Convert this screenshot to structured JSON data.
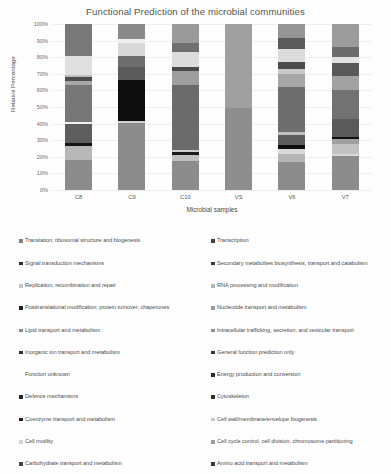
{
  "chart_data": {
    "type": "bar",
    "subtype": "stacked-percentage",
    "title": "Functional Prediction of the microbial communities",
    "xlabel": "Microbial samples",
    "ylabel": "Relative Percentage",
    "grid": true,
    "legend_position": "bottom",
    "ylim": [
      0,
      100
    ],
    "ytick_labels": [
      "0%",
      "10%",
      "20%",
      "30%",
      "40%",
      "50%",
      "60%",
      "70%",
      "80%",
      "90%",
      "100%"
    ],
    "ytick_values": [
      0,
      10,
      20,
      30,
      40,
      50,
      60,
      70,
      80,
      90,
      100
    ],
    "categories": [
      "C8",
      "C9",
      "C10",
      "VS",
      "V6",
      "V7"
    ],
    "series": [
      {
        "name": "Translation, ribosomal structure and biogenesis",
        "color": "#8c8c8c",
        "values": [
          18.0,
          40.5,
          17.5,
          49.5,
          17.0,
          20.5
        ]
      },
      {
        "name": "Transcription",
        "color": "#a6a6a6",
        "values": [
          8.5,
          0.8,
          4.5,
          50.5,
          4.5,
          2.0
        ]
      },
      {
        "name": "Signal transduction mechanisms",
        "color": "#151515",
        "values": [
          1.8,
          25.0,
          1.5,
          0.0,
          2.5,
          1.0
        ]
      },
      {
        "name": "Secondary metabolites biosynthesis, transport and catabolism",
        "color": "#595959",
        "values": [
          11.0,
          0.0,
          39.5,
          0.0,
          3.5,
          0.0
        ]
      },
      {
        "name": "Replication, recombination and repair",
        "color": "#bfbfbf",
        "values": [
          0.0,
          0.0,
          0.0,
          0.0,
          3.0,
          5.5
        ]
      },
      {
        "name": "RNA processing and modification",
        "color": "#d9d9d9",
        "values": [
          0.0,
          0.0,
          0.0,
          0.0,
          4.5,
          2.5
        ]
      },
      {
        "name": "Posttranslational modification, protein turnover, chaperones",
        "color": "#6e6e6e",
        "values": [
          13.5,
          6.0,
          0.0,
          0.0,
          23.0,
          25.0
        ]
      },
      {
        "name": "Nucleotide transport and metabolism",
        "color": "#9e9e9e",
        "values": [
          4.5,
          0.0,
          8.5,
          0.0,
          5.0,
          4.5
        ]
      },
      {
        "name": "Lipid transport and metabolism",
        "color": "#4a4a4a",
        "values": [
          3.5,
          7.5,
          2.0,
          0.0,
          5.0,
          10.0
        ]
      },
      {
        "name": "Intracellular trafficking, secretion, and vesicular transport",
        "color": "#c8c8c8",
        "values": [
          0.0,
          0.0,
          0.0,
          0.0,
          2.0,
          3.5
        ]
      },
      {
        "name": "Inorganic ion transport and metabolism",
        "color": "#787878",
        "values": [
          0.0,
          0.0,
          0.0,
          0.0,
          0.0,
          0.0
        ]
      },
      {
        "name": "General function prediction only",
        "color": "#5f5f5f",
        "values": [
          0.0,
          0.0,
          0.0,
          0.0,
          0.0,
          0.0
        ]
      },
      {
        "name": "Function unknown",
        "color": "#ffffff",
        "values": [
          10.5,
          5.0,
          10.5,
          0.0,
          6.0,
          4.5
        ]
      },
      {
        "name": "Energy production and conversion",
        "color": "#3d3d3d",
        "values": [
          0.0,
          0.0,
          0.0,
          0.0,
          0.0,
          0.0
        ]
      },
      {
        "name": "Defence mechanisms",
        "color": "#2b2b2b",
        "values": [
          0.0,
          0.0,
          0.0,
          0.0,
          0.0,
          0.0
        ]
      },
      {
        "name": "Cytoskeleton",
        "color": "#525252",
        "values": [
          0.0,
          0.0,
          0.0,
          0.0,
          0.0,
          0.0
        ]
      },
      {
        "name": "Coenzyme transport and metabolism",
        "color": "#1f1f1f",
        "values": [
          0.0,
          0.0,
          0.0,
          0.0,
          0.0,
          0.0
        ]
      },
      {
        "name": "Cell wall/membrane/envelope biogenesis",
        "color": "#d0d0d0",
        "values": [
          0.0,
          0.0,
          0.0,
          0.0,
          0.0,
          0.0
        ]
      },
      {
        "name": "Cell motility",
        "color": "#e2e2e2",
        "values": [
          0.0,
          0.0,
          0.0,
          0.0,
          0.0,
          0.0
        ]
      },
      {
        "name": "Cell cycle control, cell division, chromosome partitioning",
        "color": "#b0b0b0",
        "values": [
          0.0,
          0.0,
          0.0,
          0.0,
          0.0,
          0.0
        ]
      },
      {
        "name": "Carbohydrate transport and metabolism",
        "color": "#707070",
        "values": [
          0.0,
          0.0,
          0.0,
          0.0,
          0.0,
          0.0
        ]
      },
      {
        "name": "Amino acid transport and metabolism",
        "color": "#868686",
        "values": [
          28.7,
          15.2,
          16.0,
          0.0,
          24.0,
          21.0
        ]
      }
    ],
    "stacks": {
      "C8": [
        {
          "from": 0,
          "to": 18.0,
          "color": "#8c8c8c"
        },
        {
          "from": 18.0,
          "to": 26.5,
          "color": "#b8b8b8"
        },
        {
          "from": 26.5,
          "to": 28.3,
          "color": "#151515"
        },
        {
          "from": 28.3,
          "to": 39.5,
          "color": "#5e5e5e"
        },
        {
          "from": 39.5,
          "to": 41.0,
          "color": "#efefef"
        },
        {
          "from": 41.0,
          "to": 63.0,
          "color": "#777777"
        },
        {
          "from": 63.0,
          "to": 65.5,
          "color": "#a8a8a8"
        },
        {
          "from": 65.5,
          "to": 68.0,
          "color": "#4c4c4c"
        },
        {
          "from": 68.0,
          "to": 69.5,
          "color": "#bdbdbd"
        },
        {
          "from": 69.5,
          "to": 81.0,
          "color": "#e0e0e0"
        },
        {
          "from": 81.0,
          "to": 100,
          "color": "#787878"
        }
      ],
      "C9": [
        {
          "from": 0,
          "to": 40.5,
          "color": "#8c8c8c"
        },
        {
          "from": 40.5,
          "to": 41.5,
          "color": "#d2d2d2"
        },
        {
          "from": 41.5,
          "to": 66.5,
          "color": "#0d0d0d"
        },
        {
          "from": 66.5,
          "to": 74.0,
          "color": "#5a5a5a"
        },
        {
          "from": 74.0,
          "to": 80.5,
          "color": "#6e6e6e"
        },
        {
          "from": 80.5,
          "to": 88.5,
          "color": "#d8d8d8"
        },
        {
          "from": 88.5,
          "to": 91.0,
          "color": "#f0f0f0"
        },
        {
          "from": 91.0,
          "to": 100,
          "color": "#8a8a8a"
        }
      ],
      "C10": [
        {
          "from": 0,
          "to": 17.5,
          "color": "#8c8c8c"
        },
        {
          "from": 17.5,
          "to": 21.0,
          "color": "#bfbfbf"
        },
        {
          "from": 21.0,
          "to": 23.0,
          "color": "#1a1a1a"
        },
        {
          "from": 23.0,
          "to": 24.0,
          "color": "#cfcfcf"
        },
        {
          "from": 24.0,
          "to": 63.5,
          "color": "#6b6b6b"
        },
        {
          "from": 63.5,
          "to": 71.5,
          "color": "#9e9e9e"
        },
        {
          "from": 71.5,
          "to": 74.0,
          "color": "#4a4a4a"
        },
        {
          "from": 74.0,
          "to": 83.0,
          "color": "#dcdcdc"
        },
        {
          "from": 83.0,
          "to": 88.5,
          "color": "#6f6f6f"
        },
        {
          "from": 88.5,
          "to": 100,
          "color": "#9a9a9a"
        }
      ],
      "VS": [
        {
          "from": 0,
          "to": 49.5,
          "color": "#8e8e8e"
        },
        {
          "from": 49.5,
          "to": 100,
          "color": "#a0a0a0"
        }
      ],
      "V6": [
        {
          "from": 0,
          "to": 17.0,
          "color": "#8c8c8c"
        },
        {
          "from": 17.0,
          "to": 21.5,
          "color": "#b5b5b5"
        },
        {
          "from": 21.5,
          "to": 24.5,
          "color": "#dadada"
        },
        {
          "from": 24.5,
          "to": 27.0,
          "color": "#0f0f0f"
        },
        {
          "from": 27.0,
          "to": 33.0,
          "color": "#5c5c5c"
        },
        {
          "from": 33.0,
          "to": 35.0,
          "color": "#c0c0c0"
        },
        {
          "from": 35.0,
          "to": 62.0,
          "color": "#6e6e6e"
        },
        {
          "from": 62.0,
          "to": 70.0,
          "color": "#a6a6a6"
        },
        {
          "from": 70.0,
          "to": 73.0,
          "color": "#cacaca"
        },
        {
          "from": 73.0,
          "to": 77.0,
          "color": "#4c4c4c"
        },
        {
          "from": 77.0,
          "to": 85.0,
          "color": "#dcdcdc"
        },
        {
          "from": 85.0,
          "to": 91.5,
          "color": "#5a5a5a"
        },
        {
          "from": 91.5,
          "to": 100,
          "color": "#949494"
        }
      ],
      "V7": [
        {
          "from": 0,
          "to": 20.5,
          "color": "#8c8c8c"
        },
        {
          "from": 20.5,
          "to": 22.0,
          "color": "#d8d8d8"
        },
        {
          "from": 22.0,
          "to": 28.0,
          "color": "#c2c2c2"
        },
        {
          "from": 28.0,
          "to": 30.5,
          "color": "#a0a0a0"
        },
        {
          "from": 30.5,
          "to": 31.8,
          "color": "#111111"
        },
        {
          "from": 31.8,
          "to": 43.0,
          "color": "#5a5a5a"
        },
        {
          "from": 43.0,
          "to": 60.5,
          "color": "#727272"
        },
        {
          "from": 60.5,
          "to": 68.5,
          "color": "#a2a2a2"
        },
        {
          "from": 68.5,
          "to": 76.5,
          "color": "#585858"
        },
        {
          "from": 76.5,
          "to": 80.0,
          "color": "#e2e2e2"
        },
        {
          "from": 80.0,
          "to": 86.5,
          "color": "#6b6b6b"
        },
        {
          "from": 86.5,
          "to": 100,
          "color": "#9c9c9c"
        }
      ]
    },
    "legend_entries": [
      {
        "label": "Translation, ribosomal structure and biogenesis",
        "color": "#7f7f7f"
      },
      {
        "label": "Transcription",
        "color": "#3f3f3f"
      },
      {
        "label": "Signal transduction mechanisms",
        "color": "#2a2a2a"
      },
      {
        "label": "Secondary metabolites biosynthesis, transport and catabolism",
        "color": "#3a3a3a"
      },
      {
        "label": "Replication, recombination and repair",
        "color": "#c4c4c4"
      },
      {
        "label": "RNA processing and modification",
        "color": "#b6b6b6"
      },
      {
        "label": "Posttranslational modification, protein turnover, chaperones",
        "color": "#1f1f1f"
      },
      {
        "label": "Nucleotide transport and metabolism",
        "color": "#9a9a9a"
      },
      {
        "label": "Lipid transport and metabolism",
        "color": "#8a8a8a"
      },
      {
        "label": "Intracellular trafficking, secretion, and vesicular transport",
        "color": "#8e8e8e"
      },
      {
        "label": "Inorganic ion transport and metabolism",
        "color": "#2e2e2e"
      },
      {
        "label": "General function prediction only",
        "color": "#343434"
      },
      {
        "label": "Function unknown",
        "color": "#ffffff"
      },
      {
        "label": "Energy production and conversion",
        "color": "#2c2c2c"
      },
      {
        "label": "Defence mechanisms",
        "color": "#262626"
      },
      {
        "label": "Cytoskeleton",
        "color": "#303030"
      },
      {
        "label": "Coenzyme transport and metabolism",
        "color": "#1c1c1c"
      },
      {
        "label": "Cell wall/membrane/envelope biogenesis",
        "color": "#c8c8c8"
      },
      {
        "label": "Cell motility",
        "color": "#d4d4d4"
      },
      {
        "label": "Cell cycle control, cell division, chromosome partitioning",
        "color": "#9e9e9e"
      },
      {
        "label": "Carbohydrate transport and metabolism",
        "color": "#444444"
      },
      {
        "label": "Amino acid transport and metabolism",
        "color": "#383838"
      }
    ]
  }
}
